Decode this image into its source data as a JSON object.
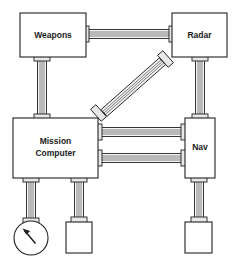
{
  "diagram": {
    "type": "block-diagram",
    "background_color": "#ffffff",
    "line_color": "#231f20",
    "fill_color": "#ffffff",
    "connector_fill": "#e8e8e8",
    "cable_fill": "#f2f2f2",
    "nodes": [
      {
        "id": "weapons",
        "label": "Weapons",
        "shape": "rectangle",
        "x": 20,
        "y": 13,
        "width": 66,
        "height": 44
      },
      {
        "id": "radar",
        "label": "Radar",
        "shape": "rectangle",
        "x": 172,
        "y": 13,
        "width": 55,
        "height": 44
      },
      {
        "id": "mission_computer",
        "label": "Mission\nComputer",
        "label_line1": "Mission",
        "label_line2": "Computer",
        "shape": "rectangle",
        "x": 13,
        "y": 118,
        "width": 85,
        "height": 60
      },
      {
        "id": "nav",
        "label": "Nav",
        "shape": "rectangle",
        "x": 185,
        "y": 118,
        "width": 30,
        "height": 60
      },
      {
        "id": "gauge",
        "label": "",
        "shape": "circle-gauge-with-needle",
        "cx": 31,
        "cy": 238,
        "r": 17
      },
      {
        "id": "terminal_center",
        "label": "",
        "shape": "rectangle",
        "x": 66,
        "y": 222,
        "width": 26,
        "height": 31
      },
      {
        "id": "terminal_right",
        "label": "",
        "shape": "rectangle",
        "x": 185,
        "y": 222,
        "width": 27,
        "height": 31
      }
    ],
    "edges": [
      {
        "id": "weapons-radar",
        "from": "weapons",
        "to": "radar",
        "orientation": "horizontal",
        "conductors": 4
      },
      {
        "id": "weapons-mc",
        "from": "weapons",
        "to": "mission_computer",
        "orientation": "vertical",
        "conductors": 4
      },
      {
        "id": "mc-radar",
        "from": "mission_computer",
        "to": "radar",
        "orientation": "diagonal",
        "conductors": 4
      },
      {
        "id": "mc-nav-upper",
        "from": "mission_computer",
        "to": "nav",
        "orientation": "horizontal",
        "conductors": 4
      },
      {
        "id": "mc-nav-lower",
        "from": "mission_computer",
        "to": "nav",
        "orientation": "horizontal",
        "conductors": 4
      },
      {
        "id": "radar-nav",
        "from": "radar",
        "to": "nav",
        "orientation": "vertical",
        "conductors": 4
      },
      {
        "id": "mc-gauge",
        "from": "mission_computer",
        "to": "gauge",
        "orientation": "vertical",
        "conductors": 4
      },
      {
        "id": "mc-terminal-center",
        "from": "mission_computer",
        "to": "terminal_center",
        "orientation": "vertical",
        "conductors": 4
      },
      {
        "id": "nav-terminal-right",
        "from": "nav",
        "to": "terminal_right",
        "orientation": "vertical",
        "conductors": 4
      }
    ]
  }
}
